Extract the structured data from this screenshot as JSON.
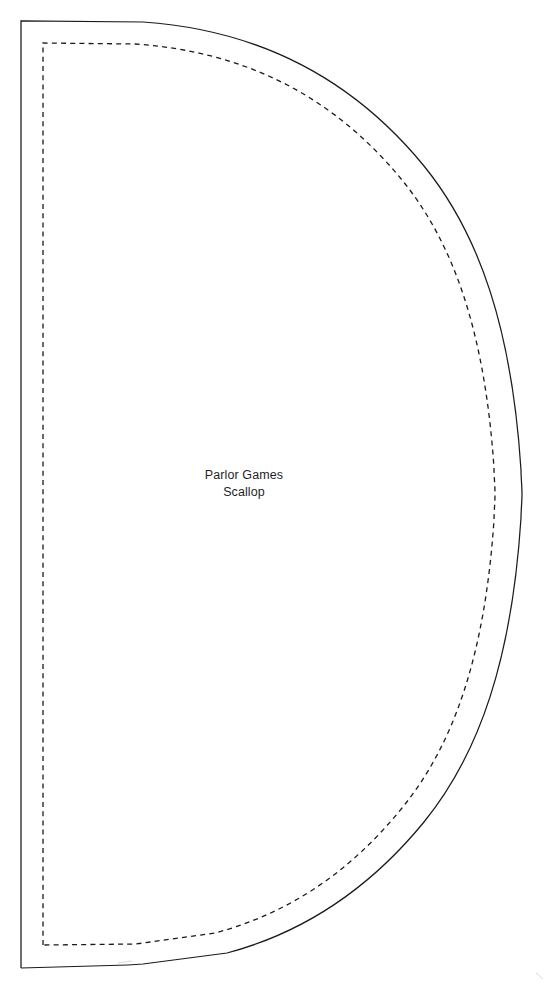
{
  "document": {
    "type": "sewing-pattern-template",
    "page_width": 548,
    "page_height": 986,
    "background_color": "#ffffff"
  },
  "label": {
    "line1": "Parlor Games",
    "line2": "Scallop",
    "center_x": 244,
    "line1_y": 479,
    "line2_y": 496,
    "font_size": 12.5,
    "color": "#1f1f1f"
  },
  "lines": {
    "cut_line": {
      "name": "cutting-line",
      "style": "solid",
      "color": "#1a1a1a",
      "stroke_width": 1.25
    },
    "seam_line": {
      "name": "seam-allowance-line",
      "style": "dashed",
      "color": "#1a1a1a",
      "stroke_width": 1.3,
      "dash_pattern": "5 4.2"
    }
  },
  "geometry": {
    "cut": {
      "left_x": 21,
      "top_y": 21,
      "bottom_y": 968,
      "right_max_x": 522,
      "mid_y": 494,
      "gap_start_x": 128,
      "gap_end_x": 143
    },
    "seam": {
      "left_x": 43,
      "top_y": 43,
      "bottom_y": 945,
      "right_max_x": 497,
      "mid_y": 494
    }
  },
  "paths": {
    "cut_outline_upper": "M 21 968 L 21 21 L 143 22 C 260 30 352 78 424 166 C 480 235 512 330 521 470 C 521 478 522 486 522 494",
    "cut_outline_lower": "M 522 494 C 522 502 521 510 521 518 C 512 658 480 753 424 822 C 370 888 306 932 227 953 L 143 964 L 128 965",
    "cut_gap_left": "M 128 965 L 21 968",
    "seam_outline": "M 43 945 L 43 43 L 136 44 C 247 52 334 97 402 180 C 455 245 485 335 494 468 C 494 476 495 485 495 494 C 495 503 494 512 494 520 C 485 653 455 743 402 808 C 351 871 290 913 215 933 L 136 944 L 43 945",
    "faint_mark_bottom": "M 118 963 L 132 961",
    "faint_mark_corner": "M 536 973 L 543 979"
  }
}
